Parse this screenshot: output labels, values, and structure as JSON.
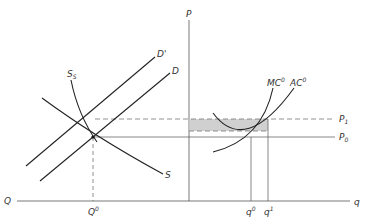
{
  "diagram": {
    "title": "",
    "left_panel": {
      "axis_label_q": "Q",
      "equilibrium_q_label": "Q",
      "equilibrium_q_sup": "0",
      "curves": {
        "demand": "D",
        "demand_shifted": "D'",
        "supply": "S",
        "short_run_supply": "S",
        "short_run_supply_sub": "S"
      }
    },
    "right_panel": {
      "axis_label_p": "P",
      "axis_label_q": "q",
      "price_high": "P",
      "price_high_sub": "1",
      "price_low": "P",
      "price_low_sub": "0",
      "q0_label": "q",
      "q0_sup": "0",
      "q1_label": "q",
      "q1_sup": "1",
      "mc_label": "MC",
      "mc_sup": "0",
      "ac_label": "AC",
      "ac_sup": "0"
    },
    "colors": {
      "line": "#222222",
      "dashed": "#777777",
      "shade": "#c8c8c8",
      "text": "#333333"
    }
  }
}
